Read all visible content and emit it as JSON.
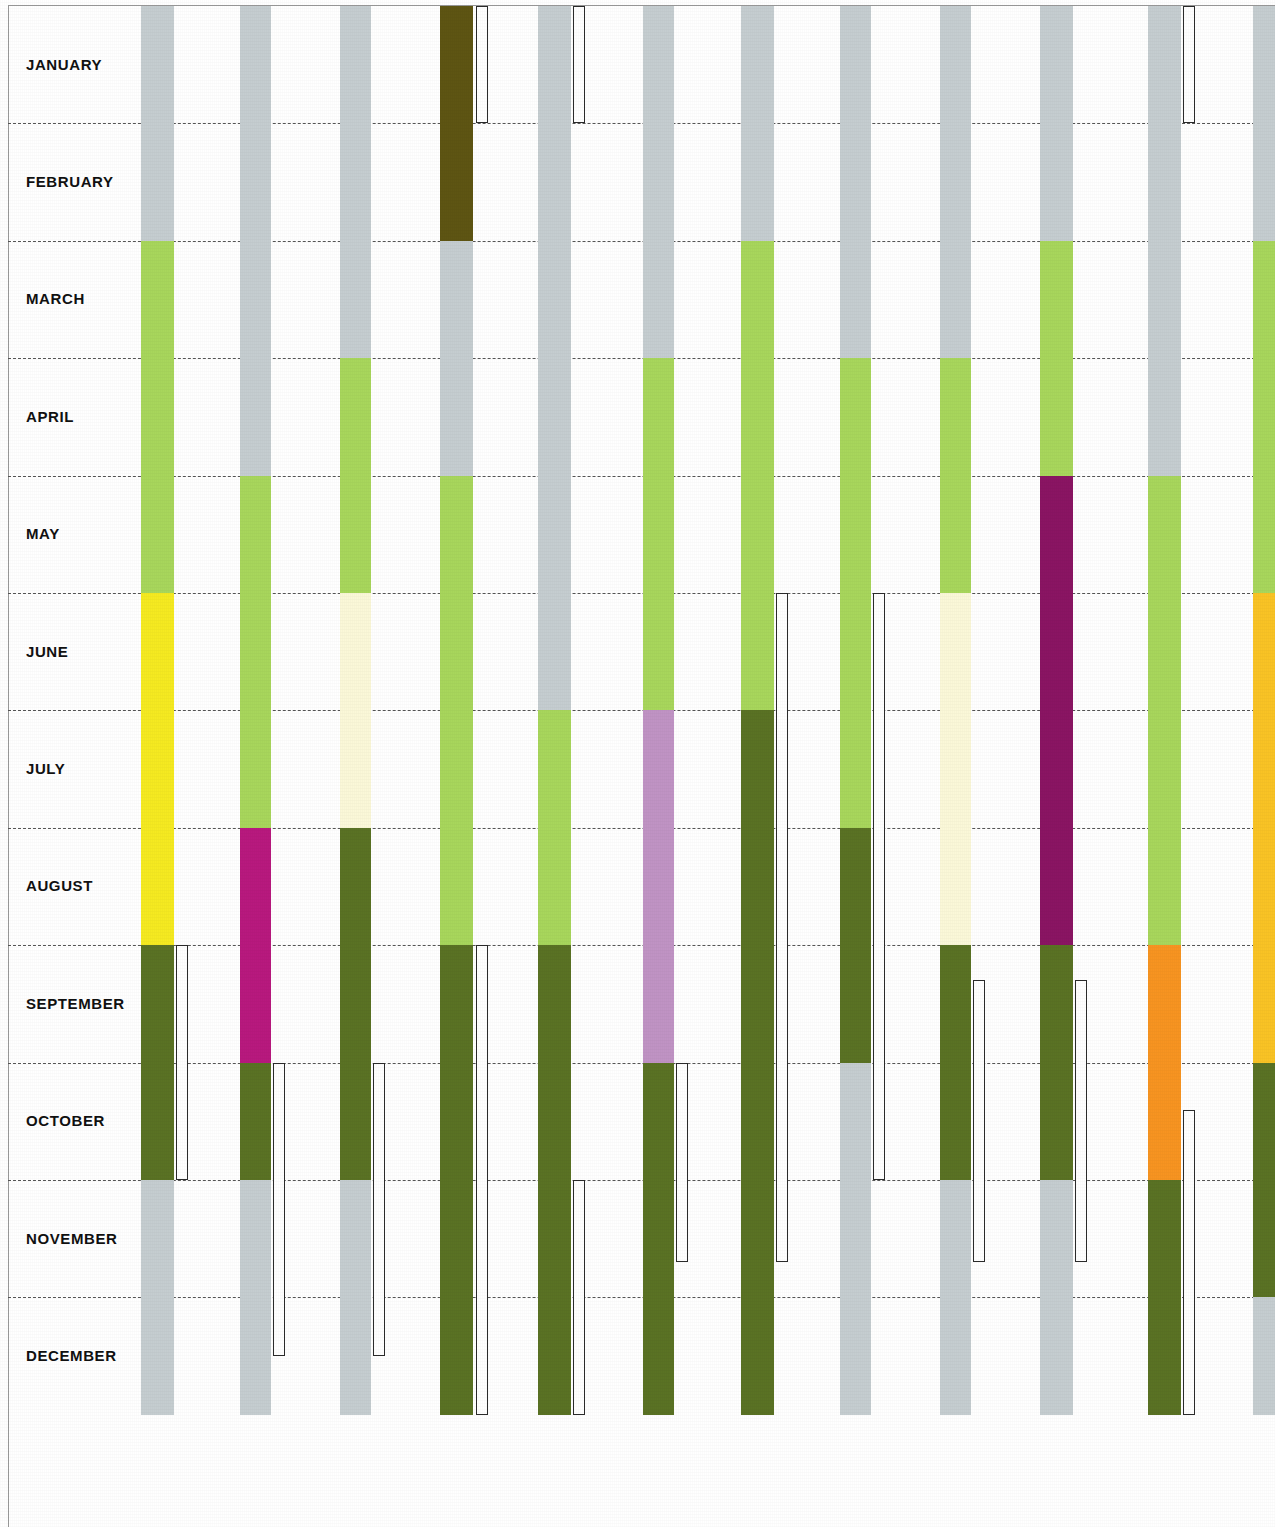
{
  "chart_data": {
    "type": "bar",
    "title": "",
    "subtitle": "",
    "xlabel": "",
    "ylabel": "",
    "orientation": "vertical-timeline",
    "grid": true,
    "legend_position": "none",
    "categories": [
      "JANUARY",
      "FEBRUARY",
      "MARCH",
      "APRIL",
      "MAY",
      "JUNE",
      "JULY",
      "AUGUST",
      "SEPTEMBER",
      "OCTOBER",
      "NOVEMBER",
      "DECEMBER"
    ],
    "axis_range_months": [
      1,
      12
    ],
    "palette": {
      "grey": "#c5cdd0",
      "light_green": "#a8d65c",
      "dark_green": "#5a7224",
      "olive_brown": "#5e5513",
      "yellow": "#f5ea21",
      "cream": "#fbf8d8",
      "magenta": "#b8197e",
      "purple": "#8a1563",
      "lilac": "#c093c4",
      "orange": "#f79421",
      "gold": "#f9c325",
      "outline": "#2b2b2b"
    },
    "series": [
      {
        "name": "Column 1",
        "x_px": 141,
        "width_px": 33,
        "segments": [
          {
            "color": "grey",
            "start_month": 1.0,
            "end_month": 3.0
          },
          {
            "color": "light_green",
            "start_month": 3.0,
            "end_month": 6.0
          },
          {
            "color": "yellow",
            "start_month": 6.0,
            "end_month": 9.0
          },
          {
            "color": "dark_green",
            "start_month": 9.0,
            "end_month": 11.0
          },
          {
            "color": "grey",
            "start_month": 11.0,
            "end_month": 13.0
          }
        ],
        "outline_bar": {
          "x_px": 176,
          "width_px": 12,
          "start_month": 9.0,
          "end_month": 11.0
        }
      },
      {
        "name": "Column 2",
        "x_px": 240,
        "width_px": 31,
        "segments": [
          {
            "color": "grey",
            "start_month": 1.0,
            "end_month": 5.0
          },
          {
            "color": "light_green",
            "start_month": 5.0,
            "end_month": 8.0
          },
          {
            "color": "magenta",
            "start_month": 8.0,
            "end_month": 10.0
          },
          {
            "color": "dark_green",
            "start_month": 10.0,
            "end_month": 11.0
          },
          {
            "color": "grey",
            "start_month": 11.0,
            "end_month": 13.0
          }
        ],
        "outline_bar": {
          "x_px": 273,
          "width_px": 12,
          "start_month": 10.0,
          "end_month": 12.5
        }
      },
      {
        "name": "Column 3",
        "x_px": 340,
        "width_px": 31,
        "segments": [
          {
            "color": "grey",
            "start_month": 1.0,
            "end_month": 4.0
          },
          {
            "color": "light_green",
            "start_month": 4.0,
            "end_month": 6.0
          },
          {
            "color": "cream",
            "start_month": 6.0,
            "end_month": 8.0
          },
          {
            "color": "dark_green",
            "start_month": 8.0,
            "end_month": 11.0
          },
          {
            "color": "grey",
            "start_month": 11.0,
            "end_month": 13.0
          }
        ],
        "outline_bar": {
          "x_px": 373,
          "width_px": 12,
          "start_month": 10.0,
          "end_month": 12.5
        }
      },
      {
        "name": "Column 4",
        "x_px": 440,
        "width_px": 33,
        "segments": [
          {
            "color": "olive_brown",
            "start_month": 1.0,
            "end_month": 3.0
          },
          {
            "color": "grey",
            "start_month": 3.0,
            "end_month": 5.0
          },
          {
            "color": "light_green",
            "start_month": 5.0,
            "end_month": 9.0
          },
          {
            "color": "dark_green",
            "start_month": 9.0,
            "end_month": 13.0
          }
        ],
        "outline_bar": {
          "x_px": 476,
          "width_px": 12,
          "start_month": 1.0,
          "end_month": 2.0
        },
        "outline_bar2": {
          "x_px": 476,
          "width_px": 12,
          "start_month": 9.0,
          "end_month": 13.0
        }
      },
      {
        "name": "Column 5",
        "x_px": 538,
        "width_px": 33,
        "segments": [
          {
            "color": "grey",
            "start_month": 1.0,
            "end_month": 7.0
          },
          {
            "color": "light_green",
            "start_month": 7.0,
            "end_month": 9.0
          },
          {
            "color": "dark_green",
            "start_month": 9.0,
            "end_month": 13.0
          }
        ],
        "outline_bar": {
          "x_px": 573,
          "width_px": 12,
          "start_month": 1.0,
          "end_month": 2.0
        },
        "outline_bar2": {
          "x_px": 573,
          "width_px": 12,
          "start_month": 11.0,
          "end_month": 13.0
        }
      },
      {
        "name": "Column 6",
        "x_px": 643,
        "width_px": 31,
        "segments": [
          {
            "color": "grey",
            "start_month": 1.0,
            "end_month": 4.0
          },
          {
            "color": "light_green",
            "start_month": 4.0,
            "end_month": 7.0
          },
          {
            "color": "lilac",
            "start_month": 7.0,
            "end_month": 10.0
          },
          {
            "color": "dark_green",
            "start_month": 10.0,
            "end_month": 13.0
          }
        ],
        "outline_bar": {
          "x_px": 676,
          "width_px": 12,
          "start_month": 10.0,
          "end_month": 11.7
        }
      },
      {
        "name": "Column 7",
        "x_px": 741,
        "width_px": 33,
        "segments": [
          {
            "color": "grey",
            "start_month": 1.0,
            "end_month": 3.0
          },
          {
            "color": "light_green",
            "start_month": 3.0,
            "end_month": 7.0
          },
          {
            "color": "dark_green",
            "start_month": 7.0,
            "end_month": 13.0
          }
        ],
        "outline_bar": {
          "x_px": 776,
          "width_px": 12,
          "start_month": 6.0,
          "end_month": 11.7
        }
      },
      {
        "name": "Column 8",
        "x_px": 840,
        "width_px": 31,
        "segments": [
          {
            "color": "grey",
            "start_month": 1.0,
            "end_month": 4.0
          },
          {
            "color": "light_green",
            "start_month": 4.0,
            "end_month": 8.0
          },
          {
            "color": "dark_green",
            "start_month": 8.0,
            "end_month": 10.0
          },
          {
            "color": "grey",
            "start_month": 10.0,
            "end_month": 13.0
          }
        ],
        "outline_bar": {
          "x_px": 873,
          "width_px": 12,
          "start_month": 6.0,
          "end_month": 11.0
        }
      },
      {
        "name": "Column 9",
        "x_px": 940,
        "width_px": 31,
        "segments": [
          {
            "color": "grey",
            "start_month": 1.0,
            "end_month": 4.0
          },
          {
            "color": "light_green",
            "start_month": 4.0,
            "end_month": 6.0
          },
          {
            "color": "cream",
            "start_month": 6.0,
            "end_month": 9.0
          },
          {
            "color": "dark_green",
            "start_month": 9.0,
            "end_month": 11.0
          },
          {
            "color": "grey",
            "start_month": 11.0,
            "end_month": 13.0
          }
        ],
        "outline_bar": {
          "x_px": 973,
          "width_px": 12,
          "start_month": 9.3,
          "end_month": 11.7
        }
      },
      {
        "name": "Column 10",
        "x_px": 1040,
        "width_px": 33,
        "segments": [
          {
            "color": "grey",
            "start_month": 1.0,
            "end_month": 3.0
          },
          {
            "color": "light_green",
            "start_month": 3.0,
            "end_month": 5.0
          },
          {
            "color": "purple",
            "start_month": 5.0,
            "end_month": 9.0
          },
          {
            "color": "dark_green",
            "start_month": 9.0,
            "end_month": 11.0
          },
          {
            "color": "grey",
            "start_month": 11.0,
            "end_month": 13.0
          }
        ],
        "outline_bar": {
          "x_px": 1075,
          "width_px": 12,
          "start_month": 9.3,
          "end_month": 11.7
        }
      },
      {
        "name": "Column 11",
        "x_px": 1148,
        "width_px": 33,
        "segments": [
          {
            "color": "grey",
            "start_month": 1.0,
            "end_month": 5.0
          },
          {
            "color": "light_green",
            "start_month": 5.0,
            "end_month": 9.0
          },
          {
            "color": "orange",
            "start_month": 9.0,
            "end_month": 11.0
          },
          {
            "color": "dark_green",
            "start_month": 11.0,
            "end_month": 13.0
          }
        ],
        "outline_bar": {
          "x_px": 1183,
          "width_px": 12,
          "start_month": 1.0,
          "end_month": 2.0
        },
        "outline_bar2": {
          "x_px": 1183,
          "width_px": 12,
          "start_month": 10.4,
          "end_month": 13.0
        }
      },
      {
        "name": "Column 12",
        "x_px": 1253,
        "width_px": 22,
        "segments": [
          {
            "color": "grey",
            "start_month": 1.0,
            "end_month": 3.0
          },
          {
            "color": "light_green",
            "start_month": 3.0,
            "end_month": 6.0
          },
          {
            "color": "gold",
            "start_month": 6.0,
            "end_month": 10.0
          },
          {
            "color": "dark_green",
            "start_month": 10.0,
            "end_month": 12.0
          },
          {
            "color": "grey",
            "start_month": 12.0,
            "end_month": 13.0
          }
        ],
        "outline_bar": null
      }
    ]
  }
}
